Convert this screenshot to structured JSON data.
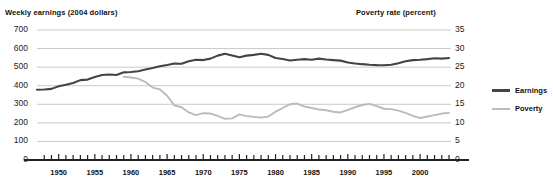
{
  "chart_data": {
    "type": "line",
    "title": "",
    "left_axis": {
      "label": "Weekly earnings (2004 dollars)",
      "ticks": [
        "700",
        "600",
        "500",
        "400",
        "300",
        "200",
        "100",
        "0"
      ],
      "ylim": [
        0,
        700
      ]
    },
    "right_axis": {
      "label": "Poverty rate (percent)",
      "ticks": [
        "35",
        "30",
        "25",
        "20",
        "15",
        "10",
        "5",
        "0"
      ],
      "ylim": [
        0,
        35
      ]
    },
    "xlabel": "",
    "xlim": [
      1947,
      2004
    ],
    "x_tick_labels": [
      "1950",
      "1955",
      "1960",
      "1965",
      "1970",
      "1975",
      "1980",
      "1985",
      "1990",
      "1995",
      "2000"
    ],
    "x_tick_years": [
      1950,
      1955,
      1960,
      1965,
      1970,
      1975,
      1980,
      1985,
      1990,
      1995,
      2000
    ],
    "x_minor_tick_interval": 1,
    "grid": true,
    "legend_position": "right",
    "legend": [
      {
        "name": "Earnings",
        "color": "#444444"
      },
      {
        "name": "Poverty",
        "color": "#bbbbbb"
      }
    ],
    "series": [
      {
        "name": "Earnings",
        "axis": "left",
        "color": "#444444",
        "x": [
          1947,
          1948,
          1949,
          1950,
          1951,
          1952,
          1953,
          1954,
          1955,
          1956,
          1957,
          1958,
          1959,
          1960,
          1961,
          1962,
          1963,
          1964,
          1965,
          1966,
          1967,
          1968,
          1969,
          1970,
          1971,
          1972,
          1973,
          1974,
          1975,
          1976,
          1977,
          1978,
          1979,
          1980,
          1981,
          1982,
          1983,
          1984,
          1985,
          1986,
          1987,
          1988,
          1989,
          1990,
          1991,
          1992,
          1993,
          1994,
          1995,
          1996,
          1997,
          1998,
          1999,
          2000,
          2001,
          2002,
          2003,
          2004
        ],
        "values": [
          378,
          380,
          383,
          397,
          405,
          415,
          430,
          433,
          447,
          458,
          460,
          458,
          472,
          474,
          478,
          487,
          495,
          505,
          512,
          520,
          518,
          532,
          540,
          538,
          546,
          562,
          572,
          563,
          553,
          562,
          566,
          572,
          566,
          549,
          544,
          536,
          540,
          543,
          540,
          546,
          541,
          538,
          535,
          525,
          520,
          516,
          513,
          511,
          510,
          513,
          521,
          532,
          538,
          540,
          543,
          548,
          546,
          549
        ]
      },
      {
        "name": "Poverty",
        "axis": "right",
        "color": "#bbbbbb",
        "x": [
          1959,
          1960,
          1961,
          1962,
          1963,
          1964,
          1965,
          1966,
          1967,
          1968,
          1969,
          1970,
          1971,
          1972,
          1973,
          1974,
          1975,
          1976,
          1977,
          1978,
          1979,
          1980,
          1981,
          1982,
          1983,
          1984,
          1985,
          1986,
          1987,
          1988,
          1989,
          1990,
          1991,
          1992,
          1993,
          1994,
          1995,
          1996,
          1997,
          1998,
          1999,
          2000,
          2001,
          2002,
          2003,
          2004
        ],
        "values": [
          22.4,
          22.2,
          21.9,
          21.0,
          19.5,
          19.0,
          17.3,
          14.7,
          14.2,
          12.8,
          12.1,
          12.6,
          12.5,
          11.9,
          11.1,
          11.2,
          12.3,
          11.8,
          11.6,
          11.4,
          11.7,
          13.0,
          14.0,
          15.0,
          15.2,
          14.4,
          14.0,
          13.6,
          13.4,
          13.0,
          12.8,
          13.5,
          14.2,
          14.8,
          15.1,
          14.5,
          13.8,
          13.7,
          13.3,
          12.7,
          11.9,
          11.3,
          11.7,
          12.1,
          12.5,
          12.7
        ]
      }
    ]
  }
}
